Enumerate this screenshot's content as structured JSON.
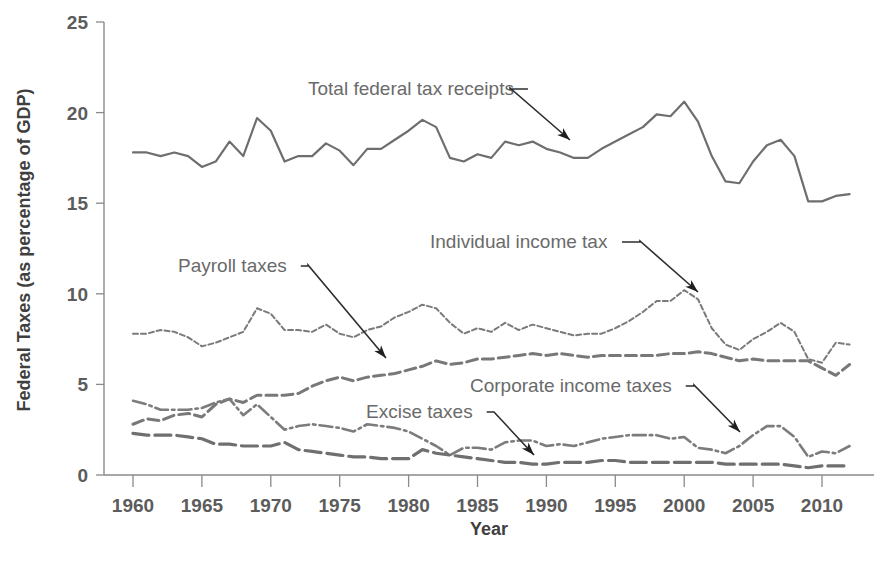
{
  "chart_data": {
    "type": "line",
    "title": "",
    "xlabel": "Year",
    "ylabel": "Federal Taxes (as percentage of GDP)",
    "xlim": [
      1959,
      2013
    ],
    "ylim": [
      0,
      25
    ],
    "grid": false,
    "legend_position": "inline-annotations",
    "xticks": [
      1960,
      1965,
      1970,
      1975,
      1980,
      1985,
      1990,
      1995,
      2000,
      2005,
      2010
    ],
    "yticks": [
      0,
      5,
      10,
      15,
      20,
      25
    ],
    "x": [
      1960,
      1961,
      1962,
      1963,
      1964,
      1965,
      1966,
      1967,
      1968,
      1969,
      1970,
      1971,
      1972,
      1973,
      1974,
      1975,
      1976,
      1977,
      1978,
      1979,
      1980,
      1981,
      1982,
      1983,
      1984,
      1985,
      1986,
      1987,
      1988,
      1989,
      1990,
      1991,
      1992,
      1993,
      1994,
      1995,
      1996,
      1997,
      1998,
      1999,
      2000,
      2001,
      2002,
      2003,
      2004,
      2005,
      2006,
      2007,
      2008,
      2009,
      2010,
      2011,
      2012
    ],
    "series": [
      {
        "name": "Total federal tax receipts",
        "style": "solid",
        "color": "#6e6e6e",
        "values": [
          17.8,
          17.8,
          17.6,
          17.8,
          17.6,
          17.0,
          17.3,
          18.4,
          17.6,
          19.7,
          19.0,
          17.3,
          17.6,
          17.6,
          18.3,
          17.9,
          17.1,
          18.0,
          18.0,
          18.5,
          19.0,
          19.6,
          19.2,
          17.5,
          17.3,
          17.7,
          17.5,
          18.4,
          18.2,
          18.4,
          18.0,
          17.8,
          17.5,
          17.5,
          18.0,
          18.4,
          18.8,
          19.2,
          19.9,
          19.8,
          20.6,
          19.5,
          17.6,
          16.2,
          16.1,
          17.3,
          18.2,
          18.5,
          17.6,
          15.1,
          15.1,
          15.4,
          15.5
        ]
      },
      {
        "name": "Individual income tax",
        "style": "fine-dashed",
        "color": "#7a7a7a",
        "values": [
          7.8,
          7.8,
          8.0,
          7.9,
          7.6,
          7.1,
          7.3,
          7.6,
          7.9,
          9.2,
          8.9,
          8.0,
          8.0,
          7.9,
          8.3,
          7.8,
          7.6,
          8.0,
          8.2,
          8.7,
          9.0,
          9.4,
          9.2,
          8.4,
          7.8,
          8.1,
          7.9,
          8.4,
          8.0,
          8.3,
          8.1,
          7.9,
          7.7,
          7.8,
          7.8,
          8.1,
          8.5,
          9.0,
          9.6,
          9.6,
          10.2,
          9.7,
          8.1,
          7.2,
          6.9,
          7.5,
          7.9,
          8.4,
          7.9,
          6.4,
          6.2,
          7.3,
          7.2
        ]
      },
      {
        "name": "Payroll taxes",
        "style": "dashed",
        "color": "#787878",
        "values": [
          2.8,
          3.1,
          3.0,
          3.3,
          3.4,
          3.2,
          3.9,
          4.2,
          4.0,
          4.4,
          4.4,
          4.4,
          4.5,
          4.9,
          5.2,
          5.4,
          5.2,
          5.4,
          5.5,
          5.6,
          5.8,
          6.0,
          6.3,
          6.1,
          6.2,
          6.4,
          6.4,
          6.5,
          6.6,
          6.7,
          6.6,
          6.7,
          6.6,
          6.5,
          6.6,
          6.6,
          6.6,
          6.6,
          6.6,
          6.7,
          6.7,
          6.8,
          6.7,
          6.5,
          6.3,
          6.4,
          6.3,
          6.3,
          6.3,
          6.3,
          5.9,
          5.5,
          6.1
        ]
      },
      {
        "name": "Corporate income taxes",
        "style": "dash-dot",
        "color": "#7c7c7c",
        "values": [
          4.1,
          3.9,
          3.6,
          3.6,
          3.6,
          3.7,
          4.0,
          4.2,
          3.3,
          3.9,
          3.2,
          2.5,
          2.7,
          2.8,
          2.7,
          2.6,
          2.4,
          2.8,
          2.7,
          2.6,
          2.4,
          2.0,
          1.6,
          1.1,
          1.5,
          1.5,
          1.4,
          1.8,
          1.9,
          1.9,
          1.6,
          1.7,
          1.6,
          1.8,
          2.0,
          2.1,
          2.2,
          2.2,
          2.2,
          2.0,
          2.1,
          1.5,
          1.4,
          1.2,
          1.6,
          2.2,
          2.7,
          2.7,
          2.1,
          1.0,
          1.3,
          1.2,
          1.6
        ]
      },
      {
        "name": "Excise taxes",
        "style": "long-dash",
        "color": "#6f6f6f",
        "values": [
          2.3,
          2.2,
          2.2,
          2.2,
          2.1,
          2.0,
          1.7,
          1.7,
          1.6,
          1.6,
          1.6,
          1.8,
          1.4,
          1.3,
          1.2,
          1.1,
          1.0,
          1.0,
          0.9,
          0.9,
          0.9,
          1.4,
          1.2,
          1.1,
          1.0,
          0.9,
          0.8,
          0.7,
          0.7,
          0.6,
          0.6,
          0.7,
          0.7,
          0.7,
          0.8,
          0.8,
          0.7,
          0.7,
          0.7,
          0.7,
          0.7,
          0.7,
          0.7,
          0.6,
          0.6,
          0.6,
          0.6,
          0.6,
          0.5,
          0.4,
          0.5,
          0.5,
          0.5
        ]
      }
    ],
    "annotations": [
      {
        "label": "Total federal tax receipts",
        "target_x": 1993,
        "target_y": 18.2
      },
      {
        "label": "Individual income tax",
        "target_x": 2000,
        "target_y": 10.2
      },
      {
        "label": "Payroll taxes",
        "target_x": 1978,
        "target_y": 5.5
      },
      {
        "label": "Corporate income taxes",
        "target_x": 2004,
        "target_y": 1.6
      },
      {
        "label": "Excise taxes",
        "target_x": 1989,
        "target_y": 0.6
      }
    ]
  },
  "axes": {
    "y_title": "Federal Taxes (as percentage of GDP)",
    "x_title": "Year",
    "y_tick_labels": [
      "0",
      "5",
      "10",
      "15",
      "20",
      "25"
    ],
    "x_tick_labels": [
      "1960",
      "1965",
      "1970",
      "1975",
      "1980",
      "1985",
      "1990",
      "1995",
      "2000",
      "2005",
      "2010"
    ]
  },
  "annotations": {
    "total_federal_tax_receipts": "Total federal tax receipts",
    "individual_income_tax": "Individual income tax",
    "payroll_taxes": "Payroll taxes",
    "corporate_income_taxes": "Corporate income taxes",
    "excise_taxes": "Excise taxes"
  },
  "colors": {
    "line": "#6e6e6e",
    "axis": "#8a8a8a",
    "text": "#5c5c5c",
    "leader": "#1f1f1f",
    "background": "#ffffff"
  }
}
